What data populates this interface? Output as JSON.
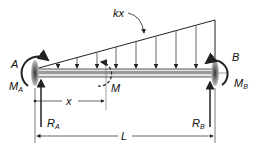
{
  "diagram": {
    "type": "beam-free-body",
    "labels": {
      "load": "kx",
      "end_a": "A",
      "end_b": "B",
      "moment_a": "M",
      "moment_a_sub": "A",
      "moment_b": "M",
      "moment_b_sub": "B",
      "section_moment": "M",
      "reaction_a": "R",
      "reaction_a_sub": "A",
      "reaction_b": "R",
      "reaction_b_sub": "B",
      "dim_x": "x",
      "dim_l": "L"
    },
    "colors": {
      "line": "#222222",
      "beam": "#9a9a9a",
      "shade": "#555555"
    }
  }
}
